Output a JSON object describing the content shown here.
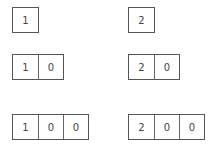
{
  "left_column": [
    {
      "digits": [
        "1"
      ]
    },
    {
      "digits": [
        "1",
        "0"
      ]
    },
    {
      "digits": [
        "1",
        "0",
        "0"
      ]
    }
  ],
  "right_column": [
    {
      "digits": [
        "2"
      ]
    },
    {
      "digits": [
        "2",
        "0"
      ]
    },
    {
      "digits": [
        "2",
        "0",
        "0"
      ]
    }
  ]
}
